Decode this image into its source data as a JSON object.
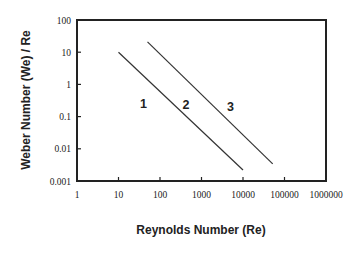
{
  "chart_data": {
    "type": "line",
    "title": "",
    "xlabel": "Reynolds Number (Re)",
    "ylabel": "Weber Number (We) / Re",
    "xscale": "log",
    "yscale": "log",
    "xlim": [
      1,
      1000000
    ],
    "ylim": [
      0.001,
      100
    ],
    "grid": false,
    "legend": "none",
    "x_tick_labels": [
      "1",
      "10",
      "100",
      "1000",
      "10000",
      "100000",
      "1000000"
    ],
    "y_tick_labels": [
      "0.001",
      "0.01",
      "0.1",
      "1",
      "10",
      "100"
    ],
    "series": [
      {
        "name": "boundary-1-2",
        "x": [
          10,
          10000
        ],
        "y": [
          10,
          0.0022
        ]
      },
      {
        "name": "boundary-2-3",
        "x": [
          50,
          52000
        ],
        "y": [
          21,
          0.0034
        ]
      }
    ],
    "annotations": [
      {
        "text": "1",
        "x": 40,
        "y": 0.25
      },
      {
        "text": "2",
        "x": 420,
        "y": 0.23
      },
      {
        "text": "3",
        "x": 5000,
        "y": 0.2
      }
    ]
  }
}
